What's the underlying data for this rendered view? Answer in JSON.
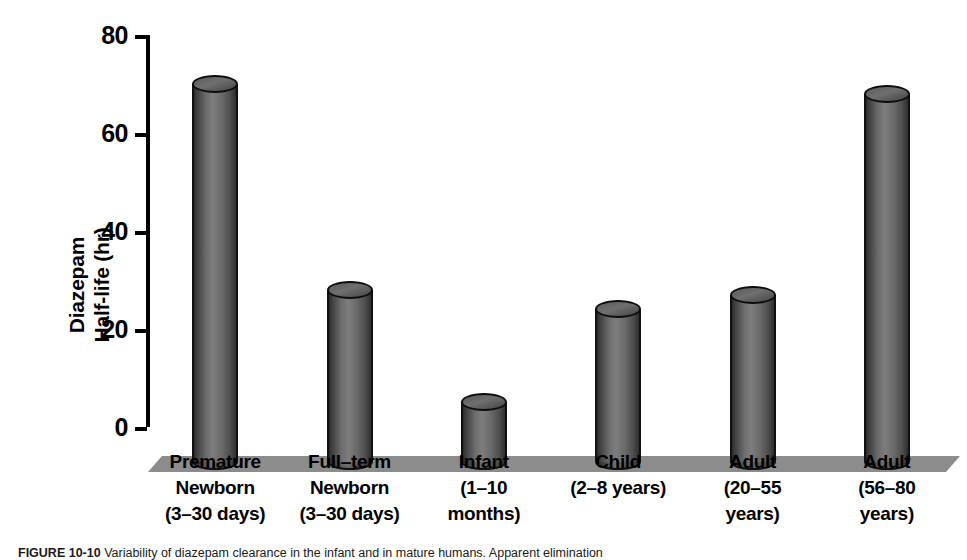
{
  "figure": {
    "caption_label": "FIGURE 10-10",
    "caption_text": "Variability of diazepam clearance in the infant and in mature humans. Apparent elimination"
  },
  "chart_data": {
    "type": "bar",
    "title": "",
    "subtitle": "",
    "xlabel": "",
    "ylabel_lines": [
      "Diazepam",
      "Half-life (hr)"
    ],
    "ylabel": "Diazepam Half-life (hr)",
    "ylim": [
      0,
      80
    ],
    "yticks": [
      0,
      20,
      40,
      60,
      80
    ],
    "ytick_labels": [
      "0",
      "20",
      "40",
      "60",
      "80"
    ],
    "grid": false,
    "legend": false,
    "legend_position": "none",
    "style": "3d-cylinder",
    "categories": [
      "Premature Newborn (3–30 days)",
      "Full–term Newborn (3–30 days)",
      "Infant (1–10 months)",
      "Child (2–8 years)",
      "Adult (20–55 years)",
      "Adult (56–80 years)"
    ],
    "category_lines": [
      [
        "Premature",
        "Newborn",
        "(3–30 days)"
      ],
      [
        "Full–term",
        "Newborn",
        "(3–30 days)"
      ],
      [
        "Infant",
        "(1–10",
        "months)"
      ],
      [
        "Child",
        "(2–8 years)"
      ],
      [
        "Adult",
        "(20–55",
        "years)"
      ],
      [
        "Adult",
        "(56–80",
        "years)"
      ]
    ],
    "values": [
      79,
      37,
      14,
      33,
      36,
      77
    ],
    "units": "hr"
  },
  "colors": {
    "bar_dark": "#2a2a2a",
    "bar_mid": "#7d7d7d",
    "bar_edge": "#111111",
    "ground": "#8c8c8c",
    "axis": "#000000",
    "background": "#ffffff"
  }
}
